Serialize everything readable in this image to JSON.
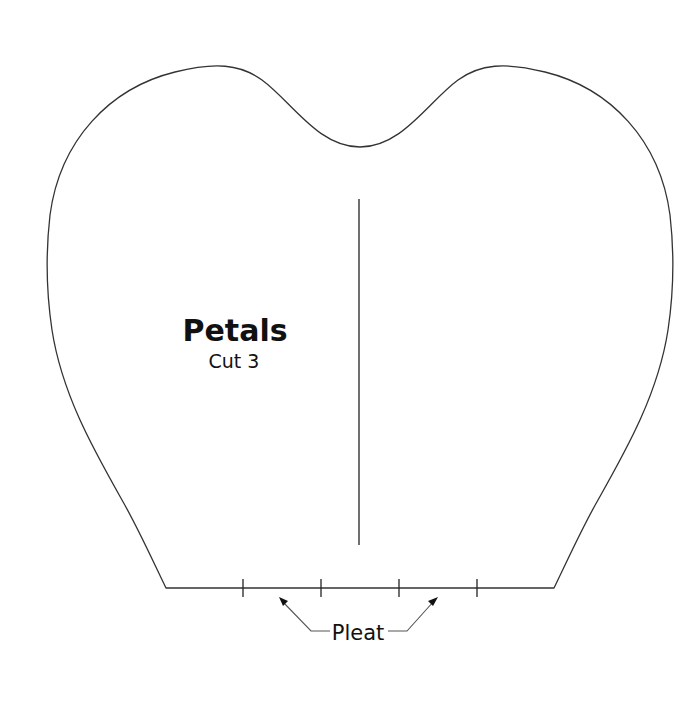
{
  "pattern": {
    "title": "Petals",
    "instruction": "Cut 3",
    "pleat_label": "Pleat",
    "colors": {
      "background": "#ffffff",
      "outline": "#333333",
      "text": "#111111"
    }
  }
}
